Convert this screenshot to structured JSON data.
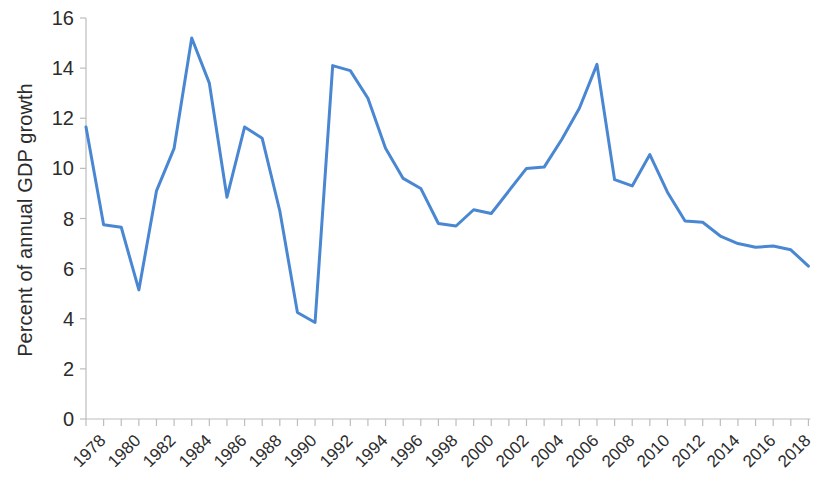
{
  "chart_data": {
    "type": "line",
    "title": "",
    "xlabel": "",
    "ylabel": "Percent of annual GDP growth",
    "ylim": [
      0,
      16
    ],
    "ytick_labels": [
      "0",
      "2",
      "4",
      "6",
      "8",
      "10",
      "12",
      "14",
      "16"
    ],
    "ytick_values": [
      0,
      2,
      4,
      6,
      8,
      10,
      12,
      14,
      16
    ],
    "xtick_labels": [
      "1978",
      "1980",
      "1982",
      "1984",
      "1986",
      "1988",
      "1990",
      "1992",
      "1994",
      "1996",
      "1998",
      "2000",
      "2002",
      "2004",
      "2006",
      "2008",
      "2010",
      "2012",
      "2014",
      "2016",
      "2018"
    ],
    "xtick_label_step_years": 2,
    "minor_tick_step_years": 1,
    "grid": false,
    "legend": false,
    "legend_position": "none",
    "line_color": "#4a87d3",
    "line_width": 3,
    "x": [
      1978,
      1979,
      1980,
      1981,
      1982,
      1983,
      1984,
      1985,
      1986,
      1987,
      1988,
      1989,
      1990,
      1991,
      1992,
      1993,
      1994,
      1995,
      1996,
      1997,
      1998,
      1999,
      2000,
      2001,
      2002,
      2003,
      2004,
      2005,
      2006,
      2007,
      2008,
      2009,
      2010,
      2011,
      2012,
      2013,
      2014,
      2015,
      2016,
      2017,
      2018,
      2019
    ],
    "values": [
      11.65,
      7.75,
      7.65,
      5.15,
      9.1,
      10.8,
      15.2,
      13.4,
      8.85,
      11.65,
      11.2,
      8.3,
      4.25,
      3.85,
      14.1,
      13.9,
      12.8,
      10.8,
      9.6,
      9.2,
      7.8,
      7.7,
      8.35,
      8.2,
      9.1,
      10.0,
      10.05,
      11.15,
      12.4,
      14.15,
      9.55,
      9.3,
      10.55,
      9.05,
      7.9,
      7.85,
      7.3,
      7.0,
      6.85,
      6.9,
      6.75,
      6.1
    ],
    "series": [
      {
        "name": "Percent of annual GDP growth",
        "values": [
          11.65,
          7.75,
          7.65,
          5.15,
          9.1,
          10.8,
          15.2,
          13.4,
          8.85,
          11.65,
          11.2,
          8.3,
          4.25,
          3.85,
          14.1,
          13.9,
          12.8,
          10.8,
          9.6,
          9.2,
          7.8,
          7.7,
          8.35,
          8.2,
          9.1,
          10.0,
          10.05,
          11.15,
          12.4,
          14.15,
          9.55,
          9.3,
          10.55,
          9.05,
          7.9,
          7.85,
          7.3,
          7.0,
          6.85,
          6.9,
          6.75,
          6.1
        ]
      }
    ]
  }
}
